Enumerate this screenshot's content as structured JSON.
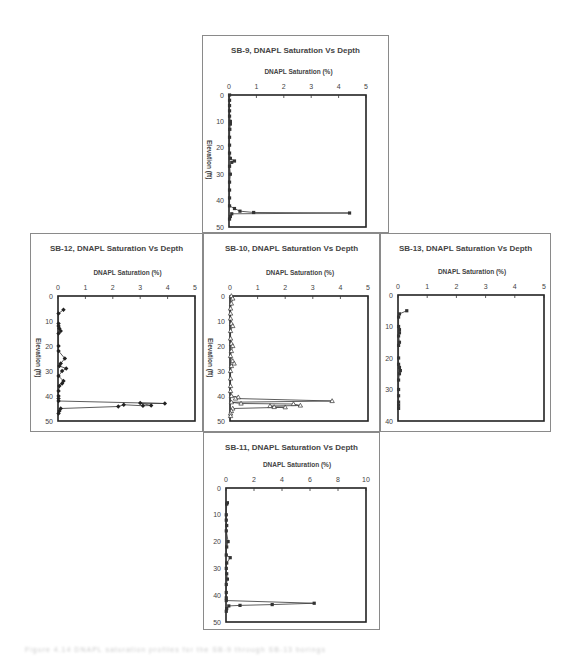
{
  "charts": [
    {
      "id": "sb9",
      "title": "SB-9, DNAPL Saturation Vs Depth",
      "xlabel": "DNAPL Saturation (%)",
      "ylabel": "Elevation (ft)",
      "frame": {
        "x": 202,
        "y": 35,
        "w": 187,
        "h": 198
      },
      "plot": {
        "x": 229,
        "y": 95,
        "w": 137,
        "h": 132
      },
      "xlim": [
        0,
        5
      ],
      "xticks": [
        0,
        1,
        2,
        3,
        4,
        5
      ],
      "xtick_labels": [
        "0",
        "1",
        "2",
        "3",
        "4",
        "5"
      ],
      "ylim": [
        0,
        50
      ],
      "yticks": [
        0,
        10,
        20,
        30,
        40,
        50
      ],
      "marker": "square",
      "points": [
        [
          0.02,
          0
        ],
        [
          0.02,
          2
        ],
        [
          0.02,
          4
        ],
        [
          0.02,
          6
        ],
        [
          0.02,
          8
        ],
        [
          0.05,
          10
        ],
        [
          0.05,
          11
        ],
        [
          0.03,
          13
        ],
        [
          0.02,
          16
        ],
        [
          0.02,
          19
        ],
        [
          0.02,
          22
        ],
        [
          0.05,
          24
        ],
        [
          0.2,
          25
        ],
        [
          0.1,
          25.5
        ],
        [
          0.02,
          27
        ],
        [
          0.05,
          30
        ],
        [
          0.02,
          33
        ],
        [
          0.02,
          36
        ],
        [
          0.02,
          39
        ],
        [
          0.02,
          42
        ],
        [
          0.2,
          43
        ],
        [
          0.4,
          44
        ],
        [
          0.9,
          44.5
        ],
        [
          4.4,
          44.7
        ],
        [
          0.1,
          45
        ],
        [
          0.05,
          46
        ],
        [
          0.02,
          47
        ]
      ]
    },
    {
      "id": "sb12",
      "title": "SB-12, DNAPL Saturation Vs Depth",
      "xlabel": "DNAPL Saturation (%)",
      "ylabel": "Elevation (ft)",
      "frame": {
        "x": 30,
        "y": 233,
        "w": 173,
        "h": 199
      },
      "plot": {
        "x": 58,
        "y": 296,
        "w": 137,
        "h": 125
      },
      "xlim": [
        0,
        5
      ],
      "xticks": [
        0,
        1,
        2,
        3,
        4,
        5
      ],
      "xtick_labels": [
        "0",
        "1",
        "2",
        "3",
        "4",
        "5"
      ],
      "ylim": [
        0,
        50
      ],
      "yticks": [
        0,
        10,
        20,
        30,
        40,
        50
      ],
      "marker": "diamond",
      "points": [
        [
          0.2,
          5.5
        ],
        [
          0.02,
          7
        ],
        [
          0.02,
          11
        ],
        [
          0.02,
          12
        ],
        [
          0.05,
          13
        ],
        [
          0.1,
          14
        ],
        [
          0.02,
          15
        ],
        [
          0.02,
          20
        ],
        [
          0.02,
          22
        ],
        [
          0.25,
          25
        ],
        [
          0.1,
          27
        ],
        [
          0.05,
          28
        ],
        [
          0.3,
          29
        ],
        [
          0.15,
          30
        ],
        [
          0.02,
          32
        ],
        [
          0.2,
          34
        ],
        [
          0.15,
          35
        ],
        [
          0.05,
          36
        ],
        [
          0.02,
          38
        ],
        [
          0.02,
          40
        ],
        [
          0.02,
          41
        ],
        [
          0.02,
          42
        ],
        [
          3.9,
          43
        ],
        [
          3.0,
          42.8
        ],
        [
          3.4,
          43.8
        ],
        [
          3.1,
          43.9
        ],
        [
          2.4,
          43.5
        ],
        [
          2.2,
          44.2
        ],
        [
          0.1,
          45
        ],
        [
          0.05,
          46
        ],
        [
          0.02,
          47
        ]
      ]
    },
    {
      "id": "sb10",
      "title": "SB-10, DNAPL Saturation Vs Depth",
      "xlabel": "DNAPL Saturation (%)",
      "ylabel": "Elevation (ft)",
      "frame": {
        "x": 203,
        "y": 233,
        "w": 177,
        "h": 199
      },
      "plot": {
        "x": 230,
        "y": 296,
        "w": 138,
        "h": 125
      },
      "xlim": [
        0,
        5
      ],
      "xticks": [
        0,
        1,
        2,
        3,
        4,
        5
      ],
      "xtick_labels": [
        "0",
        "1",
        "2",
        "3",
        "4",
        "5"
      ],
      "ylim": [
        0,
        50
      ],
      "yticks": [
        0,
        10,
        20,
        30,
        40,
        50
      ],
      "marker": "triangle",
      "points": [
        [
          0.05,
          0
        ],
        [
          0.1,
          1
        ],
        [
          0.05,
          3
        ],
        [
          0.02,
          5
        ],
        [
          0.02,
          7
        ],
        [
          0.02,
          9
        ],
        [
          0.05,
          11
        ],
        [
          0.1,
          12
        ],
        [
          0.02,
          14
        ],
        [
          0.02,
          17
        ],
        [
          0.05,
          19
        ],
        [
          0.1,
          20
        ],
        [
          0.05,
          22
        ],
        [
          0.02,
          24
        ],
        [
          0.1,
          26
        ],
        [
          0.15,
          27
        ],
        [
          0.05,
          28
        ],
        [
          0.02,
          30
        ],
        [
          0.02,
          33
        ],
        [
          0.02,
          36
        ],
        [
          0.02,
          38
        ],
        [
          0.05,
          40
        ],
        [
          0.3,
          40.5
        ],
        [
          0.2,
          41
        ],
        [
          3.7,
          42
        ],
        [
          0.05,
          42.5
        ],
        [
          0.4,
          43
        ],
        [
          2.3,
          43.2
        ],
        [
          2.55,
          43.8
        ],
        [
          1.45,
          44
        ],
        [
          1.6,
          44.4
        ],
        [
          2.0,
          44.5
        ],
        [
          0.1,
          45
        ],
        [
          0.05,
          46
        ],
        [
          0.02,
          47
        ],
        [
          0.02,
          48
        ]
      ]
    },
    {
      "id": "sb13",
      "title": "SB-13, DNAPL Saturation Vs Depth",
      "xlabel": "DNAPL Saturation (%)",
      "ylabel": "",
      "frame": {
        "x": 380,
        "y": 233,
        "w": 171,
        "h": 199
      },
      "plot": {
        "x": 398,
        "y": 295,
        "w": 146,
        "h": 126
      },
      "xlim": [
        0,
        5
      ],
      "xticks": [
        0,
        1,
        2,
        3,
        4,
        5
      ],
      "xtick_labels": [
        "0",
        "1",
        "2",
        "3",
        "4",
        "5"
      ],
      "ylim": [
        0,
        40
      ],
      "yticks": [
        0,
        10,
        20,
        30,
        40
      ],
      "marker": "square",
      "points": [
        [
          0.3,
          5
        ],
        [
          0.05,
          6
        ],
        [
          0.02,
          7
        ],
        [
          0.02,
          10
        ],
        [
          0.05,
          11
        ],
        [
          0.05,
          12
        ],
        [
          0.02,
          13
        ],
        [
          0.05,
          15
        ],
        [
          0.02,
          16
        ],
        [
          0.02,
          20
        ],
        [
          0.02,
          22
        ],
        [
          0.05,
          23
        ],
        [
          0.08,
          24
        ],
        [
          0.05,
          25
        ],
        [
          0.02,
          27
        ],
        [
          0.02,
          30
        ],
        [
          0.02,
          32
        ],
        [
          0.02,
          34
        ],
        [
          0.02,
          35
        ],
        [
          0.02,
          36
        ]
      ]
    },
    {
      "id": "sb11",
      "title": "SB-11, DNAPL Saturation Vs Depth",
      "xlabel": "DNAPL Saturation (%)",
      "ylabel": "",
      "frame": {
        "x": 203,
        "y": 432,
        "w": 177,
        "h": 198
      },
      "plot": {
        "x": 226,
        "y": 488,
        "w": 140,
        "h": 134
      },
      "xlim": [
        0,
        10
      ],
      "xticks": [
        0,
        2,
        4,
        6,
        8,
        10
      ],
      "xtick_labels": [
        "0",
        "2",
        "4",
        "6",
        "8",
        "10"
      ],
      "ylim": [
        0,
        50
      ],
      "yticks": [
        0,
        10,
        20,
        30,
        40,
        50
      ],
      "marker": "square",
      "points": [
        [
          0.1,
          5.5
        ],
        [
          0.05,
          6
        ],
        [
          0.02,
          10
        ],
        [
          0.02,
          12
        ],
        [
          0.05,
          14
        ],
        [
          0.02,
          16
        ],
        [
          0.15,
          20
        ],
        [
          0.05,
          22
        ],
        [
          0.02,
          25
        ],
        [
          0.3,
          26
        ],
        [
          0.05,
          28
        ],
        [
          0.02,
          30
        ],
        [
          0.05,
          32
        ],
        [
          0.1,
          34
        ],
        [
          0.02,
          36
        ],
        [
          0.02,
          39
        ],
        [
          0.02,
          41
        ],
        [
          0.02,
          42
        ],
        [
          6.3,
          43
        ],
        [
          3.3,
          43.5
        ],
        [
          1.0,
          43.8
        ],
        [
          0.2,
          44
        ],
        [
          0.05,
          45
        ],
        [
          0.02,
          46
        ]
      ]
    }
  ],
  "chart_data": [
    {
      "type": "line",
      "title": "SB-9, DNAPL Saturation Vs Depth",
      "xlabel": "DNAPL Saturation (%)",
      "ylabel": "Elevation (ft)",
      "xlim": [
        0,
        5
      ],
      "ylim": [
        0,
        50
      ],
      "y_inverted": true,
      "note": "Near-zero saturation throughout; spike to ~4.4% at ~44.7 ft"
    },
    {
      "type": "line",
      "title": "SB-12, DNAPL Saturation Vs Depth",
      "xlabel": "DNAPL Saturation (%)",
      "ylabel": "Elevation (ft)",
      "xlim": [
        0,
        5
      ],
      "ylim": [
        0,
        50
      ],
      "y_inverted": true,
      "note": "Low values <0.3% above 42 ft; peak ~3.9% at ~43 ft"
    },
    {
      "type": "line",
      "title": "SB-10, DNAPL Saturation Vs Depth",
      "xlabel": "DNAPL Saturation (%)",
      "ylabel": "Elevation (ft)",
      "xlim": [
        0,
        5
      ],
      "ylim": [
        0,
        50
      ],
      "y_inverted": true,
      "note": "Peak ~3.7% at ~42 ft; secondary ~2.5% at ~44 ft"
    },
    {
      "type": "line",
      "title": "SB-13, DNAPL Saturation Vs Depth",
      "xlabel": "DNAPL Saturation (%)",
      "ylabel": "",
      "xlim": [
        0,
        5
      ],
      "ylim": [
        0,
        40
      ],
      "y_inverted": true,
      "note": "Max ~0.3% at ~5 ft, otherwise ~0"
    },
    {
      "type": "line",
      "title": "SB-11, DNAPL Saturation Vs Depth",
      "xlabel": "DNAPL Saturation (%)",
      "ylabel": "",
      "xlim": [
        0,
        10
      ],
      "ylim": [
        0,
        50
      ],
      "y_inverted": true,
      "note": "Peak ~6.3% at ~43 ft; 3.3% at ~43.5 ft; 1.0% at ~44 ft"
    }
  ],
  "caption": "Figure 4.14  DNAPL saturation profiles for the SB-9 through SB-13 borings"
}
